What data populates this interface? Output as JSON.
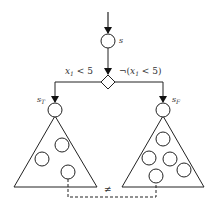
{
  "diagram": {
    "start_node": {
      "label": "s"
    },
    "branch": {
      "true_condition": {
        "var": "x",
        "sub": "1",
        "rest": " < 5"
      },
      "false_condition": {
        "prefix": "¬(",
        "var": "x",
        "sub": "1",
        "rest": " < 5)"
      }
    },
    "true_subtree": {
      "root_label": "s",
      "root_sub": "T",
      "inner_nodes": 3
    },
    "false_subtree": {
      "root_label": "s",
      "root_sub": "F",
      "inner_nodes": 5
    },
    "relation": {
      "symbol": "≠"
    },
    "colors": {
      "stroke": "#222222",
      "background": "#ffffff"
    }
  }
}
